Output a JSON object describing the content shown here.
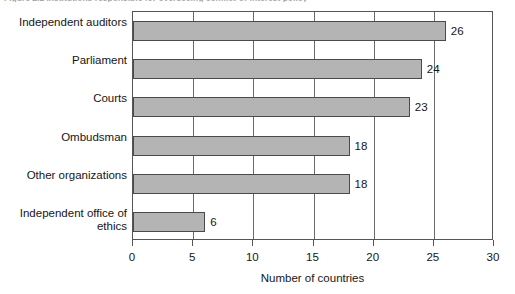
{
  "figure": {
    "title_fragment": "Figure 2.2  Institutions responsible for overseeing conflict-of-interest policy"
  },
  "chart_data": {
    "type": "bar",
    "orientation": "horizontal",
    "title": "",
    "categories": [
      "Independent auditors",
      "Parliament",
      "Courts",
      "Ombudsman",
      "Other organizations",
      "Independent office of ethics"
    ],
    "values": [
      26,
      24,
      23,
      18,
      18,
      6
    ],
    "data_labels": [
      "26",
      "24",
      "23",
      "18",
      "18",
      "6"
    ],
    "xlabel": "Number of countries",
    "ylabel": "",
    "xlim": [
      0,
      30
    ],
    "xticks": [
      0,
      5,
      10,
      15,
      20,
      25,
      30
    ],
    "xtick_labels": [
      "0",
      "5",
      "10",
      "15",
      "20",
      "25",
      "30"
    ],
    "grid": "vertical",
    "legend": "none",
    "series_color": "#b4b4b4",
    "series_edge_color": "#4a4a4a",
    "axis_color": "#555555",
    "background": "#ffffff"
  }
}
